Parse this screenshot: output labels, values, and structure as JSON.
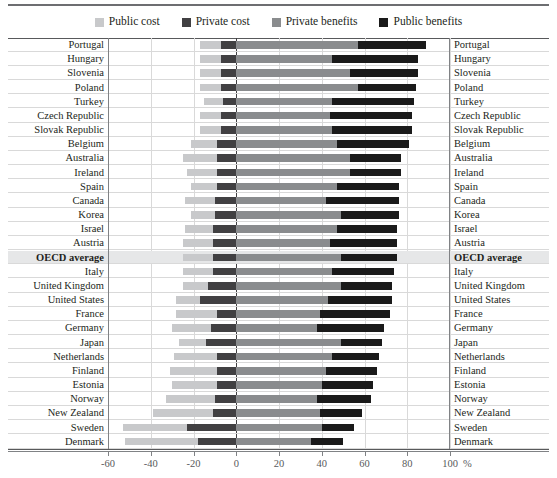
{
  "legend": {
    "items": [
      {
        "label": "Public cost",
        "color": "#c8c9cb"
      },
      {
        "label": "Private cost",
        "color": "#414042"
      },
      {
        "label": "Private benefits",
        "color": "#8a8c8e"
      },
      {
        "label": "Public benefits",
        "color": "#1a1a1a"
      }
    ]
  },
  "axis": {
    "unit": "%",
    "ticks": [
      -60,
      -40,
      -20,
      0,
      20,
      40,
      60,
      80,
      100
    ],
    "tick_labels": [
      "-60",
      "-40",
      "-20",
      "0",
      "20",
      "40",
      "60",
      "80",
      "100"
    ]
  },
  "chart_data": {
    "type": "bar",
    "orientation": "horizontal",
    "stacked": true,
    "diverging": true,
    "title": "",
    "xlabel": "%",
    "ylabel": "",
    "xlim": [
      -60,
      100
    ],
    "grid": true,
    "legend_position": "top-center",
    "series": [
      {
        "name": "Public cost",
        "color": "#c8c9cb"
      },
      {
        "name": "Private cost",
        "color": "#414042"
      },
      {
        "name": "Private benefits",
        "color": "#8a8c8e"
      },
      {
        "name": "Public benefits",
        "color": "#1a1a1a"
      }
    ],
    "categories": [
      "Portugal",
      "Hungary",
      "Slovenia",
      "Poland",
      "Turkey",
      "Czech Republic",
      "Slovak Republic",
      "Belgium",
      "Australia",
      "Ireland",
      "Spain",
      "Canada",
      "Korea",
      "Israel",
      "Austria",
      "OECD average",
      "Italy",
      "United Kingdom",
      "United States",
      "France",
      "Germany",
      "Japan",
      "Netherlands",
      "Finland",
      "Estonia",
      "Norway",
      "New Zealand",
      "Sweden",
      "Denmark"
    ],
    "rows": [
      {
        "category": "Portugal",
        "public_cost": -10,
        "private_cost": -7,
        "private_benefits": 57,
        "public_benefits": 32,
        "highlight": false
      },
      {
        "category": "Hungary",
        "public_cost": -10,
        "private_cost": -7,
        "private_benefits": 45,
        "public_benefits": 40,
        "highlight": false
      },
      {
        "category": "Slovenia",
        "public_cost": -10,
        "private_cost": -7,
        "private_benefits": 53,
        "public_benefits": 32,
        "highlight": false
      },
      {
        "category": "Poland",
        "public_cost": -10,
        "private_cost": -7,
        "private_benefits": 57,
        "public_benefits": 27,
        "highlight": false
      },
      {
        "category": "Turkey",
        "public_cost": -9,
        "private_cost": -6,
        "private_benefits": 45,
        "public_benefits": 38,
        "highlight": false
      },
      {
        "category": "Czech Republic",
        "public_cost": -10,
        "private_cost": -7,
        "private_benefits": 44,
        "public_benefits": 38,
        "highlight": false
      },
      {
        "category": "Slovak Republic",
        "public_cost": -10,
        "private_cost": -7,
        "private_benefits": 45,
        "public_benefits": 37,
        "highlight": false
      },
      {
        "category": "Belgium",
        "public_cost": -12,
        "private_cost": -9,
        "private_benefits": 47,
        "public_benefits": 34,
        "highlight": false
      },
      {
        "category": "Australia",
        "public_cost": -16,
        "private_cost": -9,
        "private_benefits": 53,
        "public_benefits": 24,
        "highlight": false
      },
      {
        "category": "Ireland",
        "public_cost": -14,
        "private_cost": -9,
        "private_benefits": 53,
        "public_benefits": 24,
        "highlight": false
      },
      {
        "category": "Spain",
        "public_cost": -12,
        "private_cost": -9,
        "private_benefits": 47,
        "public_benefits": 29,
        "highlight": false
      },
      {
        "category": "Canada",
        "public_cost": -14,
        "private_cost": -10,
        "private_benefits": 42,
        "public_benefits": 34,
        "highlight": false
      },
      {
        "category": "Korea",
        "public_cost": -11,
        "private_cost": -10,
        "private_benefits": 49,
        "public_benefits": 27,
        "highlight": false
      },
      {
        "category": "Israel",
        "public_cost": -13,
        "private_cost": -11,
        "private_benefits": 47,
        "public_benefits": 28,
        "highlight": false
      },
      {
        "category": "Austria",
        "public_cost": -14,
        "private_cost": -11,
        "private_benefits": 44,
        "public_benefits": 31,
        "highlight": false
      },
      {
        "category": "OECD average",
        "public_cost": -14,
        "private_cost": -11,
        "private_benefits": 49,
        "public_benefits": 26,
        "highlight": true
      },
      {
        "category": "Italy",
        "public_cost": -14,
        "private_cost": -11,
        "private_benefits": 45,
        "public_benefits": 29,
        "highlight": false
      },
      {
        "category": "United Kingdom",
        "public_cost": -12,
        "private_cost": -13,
        "private_benefits": 49,
        "public_benefits": 24,
        "highlight": false
      },
      {
        "category": "United States",
        "public_cost": -11,
        "private_cost": -17,
        "private_benefits": 43,
        "public_benefits": 30,
        "highlight": false
      },
      {
        "category": "France",
        "public_cost": -19,
        "private_cost": -9,
        "private_benefits": 39,
        "public_benefits": 33,
        "highlight": false
      },
      {
        "category": "Germany",
        "public_cost": -18,
        "private_cost": -12,
        "private_benefits": 38,
        "public_benefits": 31,
        "highlight": false
      },
      {
        "category": "Japan",
        "public_cost": -13,
        "private_cost": -14,
        "private_benefits": 49,
        "public_benefits": 19,
        "highlight": false
      },
      {
        "category": "Netherlands",
        "public_cost": -20,
        "private_cost": -9,
        "private_benefits": 45,
        "public_benefits": 22,
        "highlight": false
      },
      {
        "category": "Finland",
        "public_cost": -22,
        "private_cost": -9,
        "private_benefits": 42,
        "public_benefits": 24,
        "highlight": false
      },
      {
        "category": "Estonia",
        "public_cost": -21,
        "private_cost": -9,
        "private_benefits": 40,
        "public_benefits": 24,
        "highlight": false
      },
      {
        "category": "Norway",
        "public_cost": -23,
        "private_cost": -10,
        "private_benefits": 38,
        "public_benefits": 25,
        "highlight": false
      },
      {
        "category": "New Zealand",
        "public_cost": -28,
        "private_cost": -11,
        "private_benefits": 39,
        "public_benefits": 20,
        "highlight": false
      },
      {
        "category": "Sweden",
        "public_cost": -30,
        "private_cost": -23,
        "private_benefits": 40,
        "public_benefits": 15,
        "highlight": false
      },
      {
        "category": "Denmark",
        "public_cost": -34,
        "private_cost": -18,
        "private_benefits": 35,
        "public_benefits": 15,
        "highlight": false
      }
    ]
  }
}
